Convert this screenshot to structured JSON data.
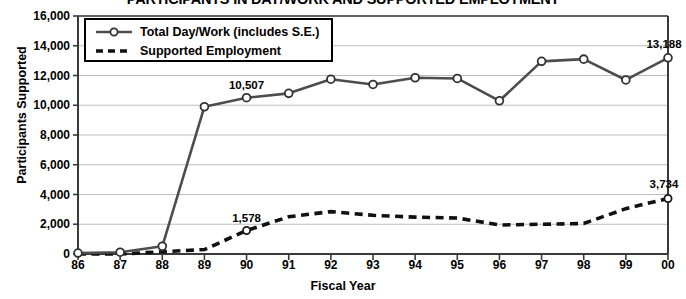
{
  "chart_data": {
    "type": "line",
    "title": "PARTICIPANTS IN DAY/WORK AND SUPPORTED EMPLOYMENT",
    "xlabel": "Fiscal Year",
    "ylabel": "Participants Supported",
    "categories": [
      "86",
      "87",
      "88",
      "89",
      "90",
      "91",
      "92",
      "93",
      "94",
      "95",
      "96",
      "97",
      "98",
      "99",
      "00"
    ],
    "ylim": [
      0,
      16000
    ],
    "ytick_labels": [
      "0",
      "2,000",
      "4,000",
      "6,000",
      "8,000",
      "10,000",
      "12,000",
      "14,000",
      "16,000"
    ],
    "ytick_values": [
      0,
      2000,
      4000,
      6000,
      8000,
      10000,
      12000,
      14000,
      16000
    ],
    "grid": true,
    "legend_position": "upper-left-inside",
    "series": [
      {
        "name": "Total Day/Work (includes S.E.)",
        "style": "solid-with-circle-markers",
        "color": "#4d4d4d",
        "values": [
          60,
          120,
          520,
          9900,
          10507,
          10800,
          11750,
          11400,
          11850,
          11800,
          10300,
          12950,
          13100,
          11700,
          13188
        ]
      },
      {
        "name": "Supported Employment",
        "style": "dashed",
        "color": "#111111",
        "values": [
          0,
          0,
          150,
          300,
          1578,
          2500,
          2850,
          2600,
          2480,
          2420,
          1950,
          2000,
          2050,
          3050,
          3734
        ]
      }
    ],
    "annotations": [
      {
        "text": "10,507",
        "series": 0,
        "category": "90",
        "value": 10507
      },
      {
        "text": "13,188",
        "series": 0,
        "category": "00",
        "value": 13188
      },
      {
        "text": "1,578",
        "series": 1,
        "category": "90",
        "value": 1578
      },
      {
        "text": "3,734",
        "series": 1,
        "category": "00",
        "value": 3734
      }
    ],
    "legend": [
      {
        "label": "Total Day/Work (includes S.E.)",
        "marker": "circle-line-marker"
      },
      {
        "label": "Supported Employment",
        "marker": "dashed-line-marker"
      }
    ]
  }
}
